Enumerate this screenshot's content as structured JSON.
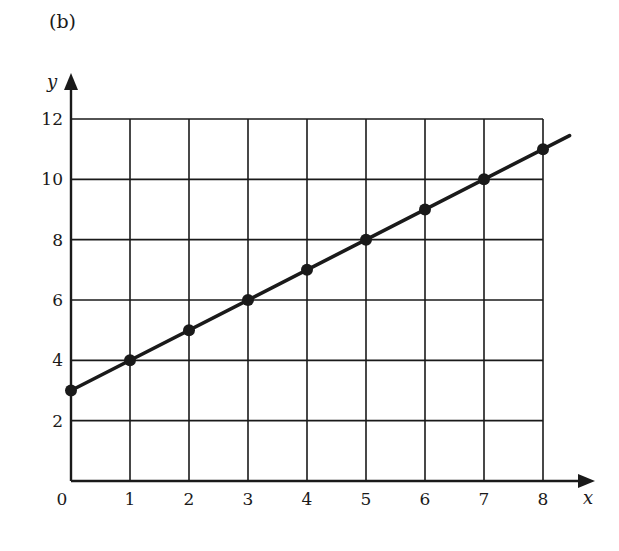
{
  "panel_label": "(b)",
  "chart_data": {
    "type": "line",
    "title": "",
    "xlabel": "x",
    "ylabel": "y",
    "x": [
      0,
      1,
      2,
      3,
      4,
      5,
      6,
      7,
      8
    ],
    "series": [
      {
        "name": "y = x + 3",
        "values": [
          3,
          4,
          5,
          6,
          7,
          8,
          9,
          10,
          11
        ],
        "markers": true,
        "line_extends_to_x": 8.45
      }
    ],
    "xlim": [
      0,
      8
    ],
    "ylim": [
      0,
      12
    ],
    "xticks": [
      0,
      1,
      2,
      3,
      4,
      5,
      6,
      7,
      8
    ],
    "yticks": [
      2,
      4,
      6,
      8,
      10,
      12
    ],
    "grid": true,
    "legend": null,
    "colors": {
      "ink": "#1a1a1a",
      "background": "#ffffff"
    }
  }
}
